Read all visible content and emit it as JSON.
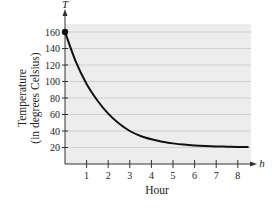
{
  "chart_data": {
    "type": "line",
    "title": "",
    "xlabel": "Hour",
    "ylabel": "Temperature (in degrees Celsius)",
    "ylabel_lines": [
      "Temperature",
      "(in degrees Celsius)"
    ],
    "x_axis_var": "h",
    "y_axis_var": "T",
    "xlim": [
      0,
      8.5
    ],
    "ylim": [
      0,
      170
    ],
    "x_ticks": [
      1,
      2,
      3,
      4,
      5,
      6,
      7,
      8
    ],
    "y_ticks": [
      20,
      40,
      60,
      80,
      100,
      120,
      140,
      160
    ],
    "grid": "horizontal",
    "legend": null,
    "series": [
      {
        "name": "Temperature",
        "x": [
          0,
          0.5,
          1,
          1.5,
          2,
          2.5,
          3,
          3.5,
          4,
          4.5,
          5,
          5.5,
          6,
          6.5,
          7,
          7.5,
          8,
          8.5
        ],
        "values": [
          160,
          124,
          97,
          77,
          61,
          49,
          40,
          34,
          30,
          27,
          25,
          23.5,
          22.5,
          21.8,
          21.3,
          21,
          20.7,
          20.5
        ],
        "color": "#111111"
      }
    ],
    "annotations": [
      {
        "type": "point",
        "x": 0,
        "y": 160,
        "marker": "filled-circle"
      }
    ]
  },
  "colors": {
    "plot_background": "#ededed",
    "gridline": "#c8c8c8",
    "curve": "#111111",
    "axis": "#333333"
  }
}
